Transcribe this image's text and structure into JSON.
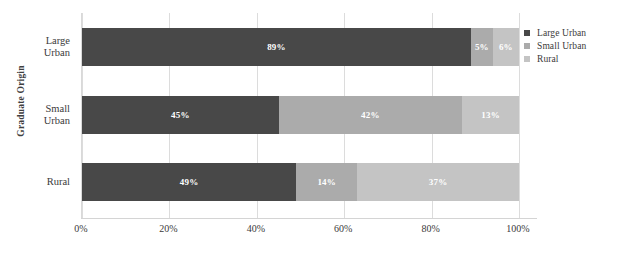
{
  "clipped_top_text": "",
  "chart_data": {
    "type": "bar",
    "orientation": "horizontal",
    "stacked": true,
    "stack_mode": "percent",
    "title": "",
    "xlabel": "",
    "ylabel": "Graduate Origin",
    "xlim": [
      0,
      100
    ],
    "grid": true,
    "legend_position": "right",
    "categories": [
      "Large Urban",
      "Small Urban",
      "Rural"
    ],
    "category_lines": [
      [
        "Large",
        "Urban"
      ],
      [
        "Small",
        "Urban"
      ],
      [
        "Rural"
      ]
    ],
    "xticks": [
      "0%",
      "20%",
      "40%",
      "60%",
      "80%",
      "100%"
    ],
    "xtick_values": [
      0,
      20,
      40,
      60,
      80,
      100
    ],
    "series": [
      {
        "name": "Large Urban",
        "color": "#484848",
        "values": [
          89,
          45,
          49
        ],
        "labels": [
          "89%",
          "45%",
          "49%"
        ]
      },
      {
        "name": "Small Urban",
        "color": "#ababab",
        "values": [
          5,
          42,
          14
        ],
        "labels": [
          "5%",
          "42%",
          "14%"
        ]
      },
      {
        "name": "Rural",
        "color": "#c4c4c4",
        "values": [
          6,
          13,
          37
        ],
        "labels": [
          "6%",
          "13%",
          "37%"
        ]
      }
    ]
  }
}
